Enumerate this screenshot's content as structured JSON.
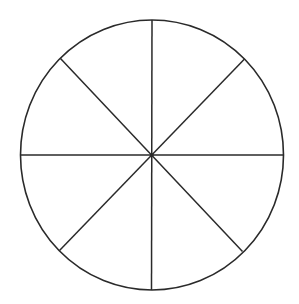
{
  "diagram": {
    "type": "circle-divided-into-sectors",
    "sector_count": 8,
    "center": {
      "x": 152,
      "y": 155
    },
    "radius_x": 131.5,
    "radius_y": 135,
    "stroke_color": "#2a2a2a",
    "background": "#ffffff",
    "spokes": [
      {
        "name": "vertical",
        "x1": 152,
        "y1": 20,
        "x2": 151.5,
        "y2": 290
      },
      {
        "name": "horizontal",
        "x1": 20.5,
        "y1": 155,
        "x2": 283.5,
        "y2": 155
      },
      {
        "name": "diagonal-tl-br",
        "x1": 60.5,
        "y1": 58.5,
        "x2": 242.5,
        "y2": 251.5
      },
      {
        "name": "diagonal-tr-bl",
        "x1": 244.5,
        "y1": 59,
        "x2": 59.5,
        "y2": 250.5
      }
    ]
  }
}
